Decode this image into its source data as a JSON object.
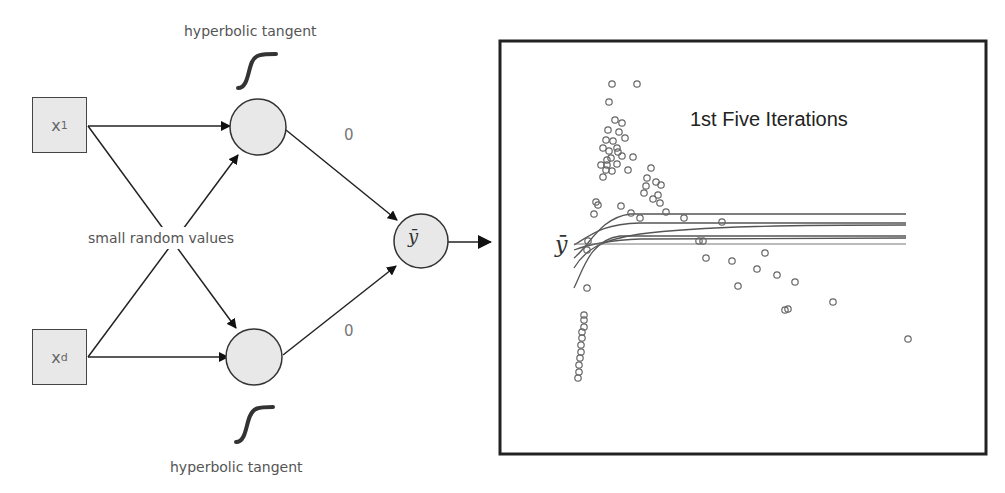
{
  "diagram": {
    "inputs": [
      {
        "id": "x1",
        "label": "x",
        "subscript": "1"
      },
      {
        "id": "xd",
        "label": "x",
        "subscript": "d"
      }
    ],
    "hidden_nodes": [
      {
        "id": "h1",
        "activation_label": "hyperbolic tangent"
      },
      {
        "id": "h2",
        "activation_label": "hyperbolic tangent"
      }
    ],
    "weights_label": "small random values",
    "output_weights": [
      "0",
      "0"
    ],
    "output_node": {
      "label": "ȳ"
    }
  },
  "chart": {
    "title": "1st Five Iterations",
    "ylabel": "ȳ"
  },
  "chart_data": {
    "type": "scatter",
    "title": "1st Five Iterations",
    "xlabel": "",
    "ylabel": "ȳ",
    "grid": false,
    "legend": "none",
    "series": [
      {
        "name": "data points",
        "type": "scatter",
        "points_px": [
          [
            612,
            84
          ],
          [
            637,
            84
          ],
          [
            609,
            102
          ],
          [
            615,
            120
          ],
          [
            622,
            123
          ],
          [
            608,
            130
          ],
          [
            606,
            140
          ],
          [
            619,
            132
          ],
          [
            613,
            141
          ],
          [
            617,
            148
          ],
          [
            625,
            138
          ],
          [
            603,
            148
          ],
          [
            609,
            151
          ],
          [
            618,
            152
          ],
          [
            622,
            156
          ],
          [
            611,
            158
          ],
          [
            607,
            165
          ],
          [
            617,
            164
          ],
          [
            601,
            165
          ],
          [
            606,
            170
          ],
          [
            603,
            177
          ],
          [
            633,
            157
          ],
          [
            628,
            170
          ],
          [
            651,
            168
          ],
          [
            647,
            178
          ],
          [
            646,
            186
          ],
          [
            656,
            182
          ],
          [
            661,
            185
          ],
          [
            644,
            193
          ],
          [
            658,
            195
          ],
          [
            653,
            199
          ],
          [
            660,
            203
          ],
          [
            596,
            202
          ],
          [
            598,
            205
          ],
          [
            621,
            206
          ],
          [
            594,
            214
          ],
          [
            666,
            212
          ],
          [
            640,
            218
          ],
          [
            684,
            218
          ],
          [
            722,
            222
          ],
          [
            631,
            213
          ],
          [
            607,
            160
          ],
          [
            612,
            171
          ],
          [
            703,
            241
          ],
          [
            699,
            241
          ],
          [
            706,
            258
          ],
          [
            732,
            261
          ],
          [
            765,
            253
          ],
          [
            757,
            269
          ],
          [
            777,
            275
          ],
          [
            795,
            282
          ],
          [
            738,
            286
          ],
          [
            833,
            302
          ],
          [
            785,
            310
          ],
          [
            788,
            309
          ],
          [
            587,
            288
          ],
          [
            587,
            250
          ],
          [
            588,
            241
          ],
          [
            584,
            315
          ],
          [
            584,
            320
          ],
          [
            584,
            327
          ],
          [
            582,
            332
          ],
          [
            582,
            338
          ],
          [
            581,
            345
          ],
          [
            581,
            352
          ],
          [
            580,
            358
          ],
          [
            579,
            365
          ],
          [
            579,
            372
          ],
          [
            578,
            378
          ],
          [
            908,
            339
          ]
        ]
      }
    ],
    "lines": [
      {
        "name": "iteration 1",
        "approx_level_px": 214
      },
      {
        "name": "iteration 2",
        "approx_level_px": 224
      },
      {
        "name": "iteration 3",
        "approx_level_px": 227
      },
      {
        "name": "iteration 4",
        "approx_level_px": 237
      },
      {
        "name": "iteration 5",
        "approx_level_px": 238
      }
    ]
  }
}
